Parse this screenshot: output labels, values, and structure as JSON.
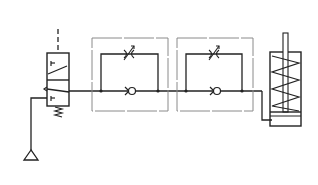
{
  "diagram": {
    "type": "pneumatic-circuit",
    "colors": {
      "line": "#222222",
      "housing": "#8a8a8a",
      "background": "#ffffff"
    },
    "components": [
      {
        "id": "valve",
        "kind": "3/2 directional valve, spring return, pilot actuated"
      },
      {
        "id": "supply",
        "kind": "pressure source (triangle)"
      },
      {
        "id": "flow-control-1",
        "kind": "one-way flow control valve (throttle + check valve)"
      },
      {
        "id": "flow-control-2",
        "kind": "one-way flow control valve (throttle + check valve)"
      },
      {
        "id": "cylinder",
        "kind": "single-acting cylinder with spring return"
      }
    ]
  }
}
